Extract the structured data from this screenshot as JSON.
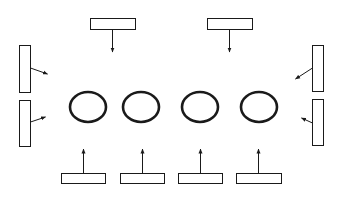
{
  "diagram": {
    "stroke_color": "#1a1a1a",
    "background": "#ffffff",
    "circles": [
      {
        "id": "circle-1",
        "cx": 88,
        "cy": 107,
        "rx": 18,
        "ry": 15
      },
      {
        "id": "circle-2",
        "cx": 141,
        "cy": 107,
        "rx": 18,
        "ry": 15
      },
      {
        "id": "circle-3",
        "cx": 200,
        "cy": 107,
        "rx": 18,
        "ry": 15
      },
      {
        "id": "circle-4",
        "cx": 259,
        "cy": 107,
        "rx": 18,
        "ry": 15
      }
    ],
    "blocks": [
      {
        "id": "top-left",
        "x": 90,
        "y": 18,
        "w": 45,
        "h": 11,
        "arrow": [
          112,
          29,
          112,
          52
        ]
      },
      {
        "id": "top-right",
        "x": 207,
        "y": 18,
        "w": 45,
        "h": 11,
        "arrow": [
          229,
          29,
          229,
          52
        ]
      },
      {
        "id": "left-upper",
        "x": 19,
        "y": 45,
        "w": 11,
        "h": 47,
        "arrow": [
          30,
          68,
          47,
          74
        ]
      },
      {
        "id": "left-lower",
        "x": 19,
        "y": 100,
        "w": 11,
        "h": 46,
        "arrow": [
          30,
          122,
          45,
          117
        ]
      },
      {
        "id": "right-upper",
        "x": 312,
        "y": 45,
        "w": 11,
        "h": 46,
        "arrow": [
          312,
          68,
          295,
          79
        ]
      },
      {
        "id": "right-lower",
        "x": 312,
        "y": 99,
        "w": 11,
        "h": 46,
        "arrow": [
          312,
          123,
          301,
          118
        ]
      },
      {
        "id": "bottom-1",
        "x": 61,
        "y": 173,
        "w": 44,
        "h": 10,
        "arrow": [
          83,
          173,
          83,
          149
        ]
      },
      {
        "id": "bottom-2",
        "x": 120,
        "y": 173,
        "w": 44,
        "h": 10,
        "arrow": [
          142,
          173,
          142,
          149
        ]
      },
      {
        "id": "bottom-3",
        "x": 178,
        "y": 173,
        "w": 44,
        "h": 10,
        "arrow": [
          200,
          173,
          200,
          149
        ]
      },
      {
        "id": "bottom-4",
        "x": 236,
        "y": 173,
        "w": 45,
        "h": 10,
        "arrow": [
          258,
          173,
          258,
          149
        ]
      }
    ]
  }
}
